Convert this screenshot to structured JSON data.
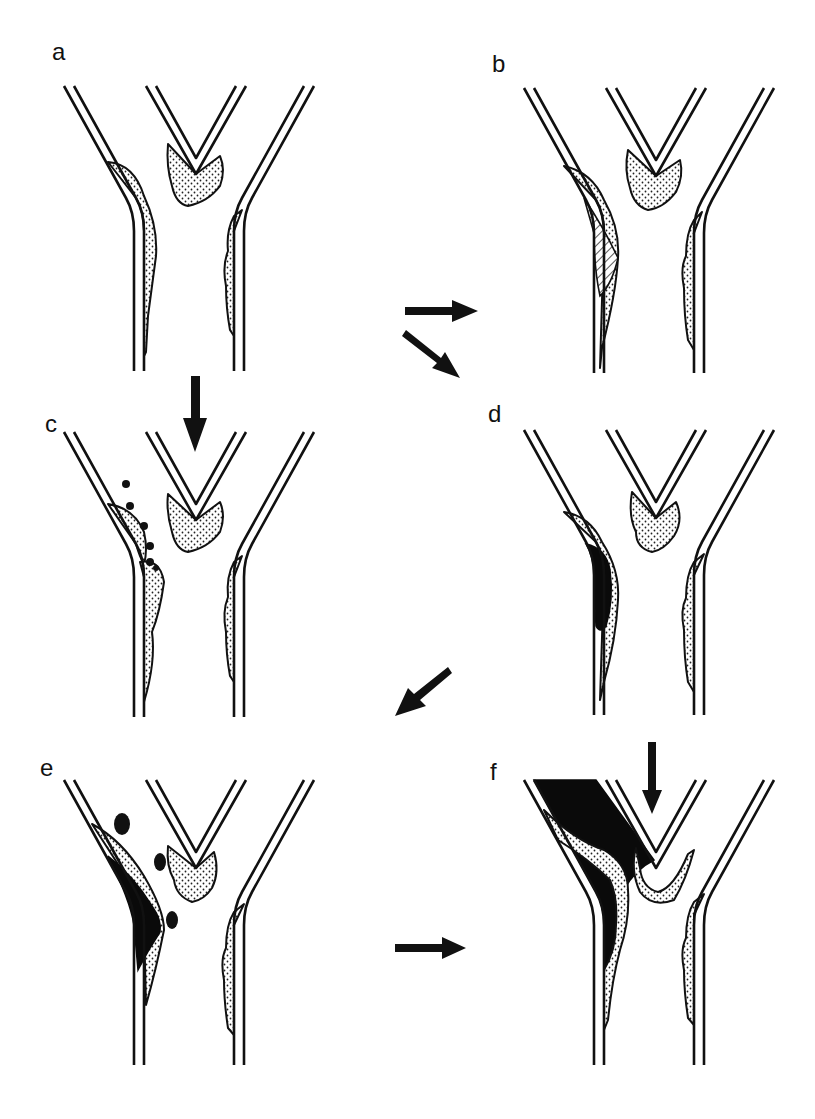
{
  "figure": {
    "panels": [
      {
        "id": "a",
        "label": "a",
        "content": "bifurcation with stippled plaque deposits on lateral walls and at flow divider"
      },
      {
        "id": "b",
        "label": "b",
        "content": "enlarged plaque on left wall with hatched core region"
      },
      {
        "id": "c",
        "label": "c",
        "content": "plaque rupture with emboli (dots) released downstream"
      },
      {
        "id": "d",
        "label": "d",
        "content": "plaque with dark thrombus core on left wall"
      },
      {
        "id": "e",
        "label": "e",
        "content": "large thrombus with embolic fragments (dark blobs)"
      },
      {
        "id": "f",
        "label": "f",
        "content": "occlusive thrombus filling left branch and bifurcation"
      }
    ],
    "arrows": [
      {
        "from": "a",
        "to": "b",
        "direction": "right"
      },
      {
        "from": "a",
        "to": "d",
        "direction": "down-right"
      },
      {
        "from": "a",
        "to": "c",
        "direction": "down",
        "note": "flow arrow into panel c"
      },
      {
        "from": "d",
        "to": "e",
        "direction": "down-left"
      },
      {
        "from": "e",
        "to": "f",
        "direction": "right"
      },
      {
        "from": "f",
        "to": "f",
        "direction": "down",
        "note": "flow arrow into panel f"
      }
    ]
  },
  "colors": {
    "ink": "#111111",
    "background": "#ffffff",
    "thrombus": "#0a0a0a"
  }
}
